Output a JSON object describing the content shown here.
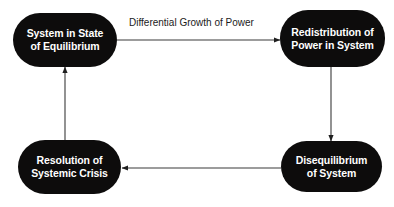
{
  "diagram": {
    "type": "cycle-flowchart",
    "title": "",
    "background_color": "#ffffff",
    "node_fill_color": "#0d0c0c",
    "node_text_color": "#ffffff",
    "edge_color": "#2b2b2b",
    "nodes": [
      {
        "id": "equilibrium",
        "label": "System in State\nof Equilibrium",
        "line1": "System in State",
        "line2": "of Equilibrium",
        "position": "top-left"
      },
      {
        "id": "redistribution",
        "label": "Redistribution of\nPower in System",
        "line1": "Redistribution of",
        "line2": "Power in System",
        "position": "top-right"
      },
      {
        "id": "disequilibrium",
        "label": "Disequilibrium\nof System",
        "line1": "Disequilibrium",
        "line2": "of System",
        "position": "bottom-right"
      },
      {
        "id": "resolution",
        "label": "Resolution of\nSystemic Crisis",
        "line1": "Resolution of",
        "line2": "Systemic Crisis",
        "position": "bottom-left"
      }
    ],
    "edges": [
      {
        "id": "equilibrium-to-redistribution",
        "from": "equilibrium",
        "to": "redistribution",
        "label": "Differential Growth of Power",
        "direction": "right"
      },
      {
        "id": "redistribution-to-disequilibrium",
        "from": "redistribution",
        "to": "disequilibrium",
        "label": "",
        "direction": "down"
      },
      {
        "id": "disequilibrium-to-resolution",
        "from": "disequilibrium",
        "to": "resolution",
        "label": "",
        "direction": "left"
      },
      {
        "id": "resolution-to-equilibrium",
        "from": "resolution",
        "to": "equilibrium",
        "label": "",
        "direction": "up"
      }
    ]
  }
}
